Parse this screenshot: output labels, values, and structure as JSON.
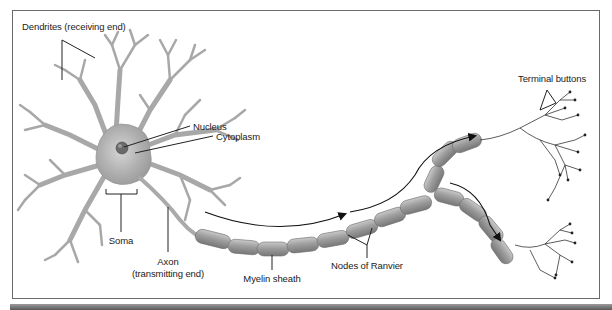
{
  "figure": {
    "type": "neuron-anatomy",
    "labels": {
      "dendrites": "Dendrites (receiving end)",
      "nucleus": "Nucleus",
      "cytoplasm": "Cytoplasm",
      "soma": "Soma",
      "axon_line1": "Axon",
      "axon_line2": "(transmitting end)",
      "myelin": "Myelin sheath",
      "nodes": "Nodes of Ranvier",
      "terminal": "Terminal buttons"
    },
    "colors": {
      "cell_fill": "#b5b5b5",
      "cell_stroke": "#8c8c8c",
      "myelin_fill": "#a9a9a9",
      "line": "#222222",
      "frame": "#6a6a6a"
    }
  }
}
